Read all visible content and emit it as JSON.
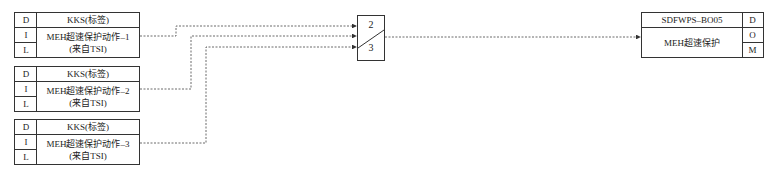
{
  "inputs": [
    {
      "d": "D",
      "i": "I",
      "l": "L",
      "tag": "KKS(标签)",
      "desc_line1": "MEH超速保护动作–1",
      "desc_line2": "(来自TSI)"
    },
    {
      "d": "D",
      "i": "I",
      "l": "L",
      "tag": "KKS(标签)",
      "desc_line1": "MEH超速保护动作–2",
      "desc_line2": "(来自TSI)"
    },
    {
      "d": "D",
      "i": "I",
      "l": "L",
      "tag": "KKS(标签)",
      "desc_line1": "MEH超速保护动作–3",
      "desc_line2": "(来自TSI)"
    }
  ],
  "voter": {
    "top_label": "2",
    "bottom_label": "3"
  },
  "output": {
    "tag": "SDFWPS–BO05",
    "desc": "MEH超速保护",
    "d": "D",
    "o": "O",
    "m": "M"
  },
  "colors": {
    "line": "#333333",
    "background": "#ffffff"
  }
}
